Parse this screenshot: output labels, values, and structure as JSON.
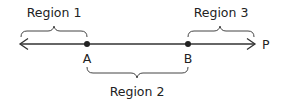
{
  "diagram": {
    "type": "number-line-regions",
    "line": {
      "direction": "both",
      "color": "#333333"
    },
    "points": [
      {
        "label": "A",
        "x": 87
      },
      {
        "label": "B",
        "x": 188
      }
    ],
    "end_label": "P",
    "regions": [
      {
        "label": "Region 1",
        "from": "left-arrow",
        "to": "A",
        "side": "above"
      },
      {
        "label": "Region 2",
        "from": "A",
        "to": "B",
        "side": "below"
      },
      {
        "label": "Region 3",
        "from": "B",
        "to": "right-arrow",
        "side": "above"
      }
    ]
  }
}
